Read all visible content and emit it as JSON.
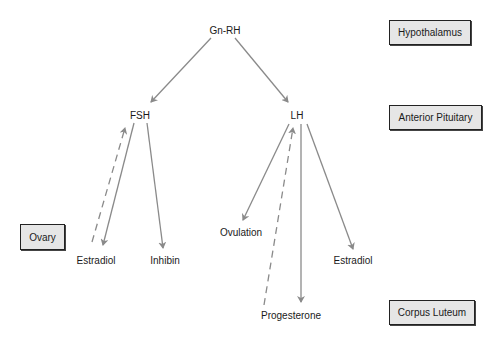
{
  "diagram": {
    "colors": {
      "arrow": "#8a8a8a",
      "box_fill": "#e6e6e6",
      "box_border": "#222222",
      "text": "#1a1a1a"
    },
    "nodes": {
      "gnrh": "Gn-RH",
      "fsh": "FSH",
      "lh": "LH",
      "estradiol_fsh": "Estradiol",
      "inhibin": "Inhibin",
      "ovulation": "Ovulation",
      "estradiol_lh": "Estradiol",
      "progesterone": "Progesterone"
    },
    "levels": {
      "hypothalamus": "Hypothalamus",
      "anterior_pituitary": "Anterior Pituitary",
      "ovary": "Ovary",
      "corpus_luteum": "Corpus Luteum"
    },
    "edges": [
      {
        "from": "Gn-RH",
        "to": "FSH",
        "style": "solid"
      },
      {
        "from": "Gn-RH",
        "to": "LH",
        "style": "solid"
      },
      {
        "from": "FSH",
        "to": "Estradiol",
        "style": "solid"
      },
      {
        "from": "FSH",
        "to": "Inhibin",
        "style": "solid"
      },
      {
        "from": "Estradiol",
        "to": "FSH",
        "style": "dashed"
      },
      {
        "from": "LH",
        "to": "Ovulation",
        "style": "solid"
      },
      {
        "from": "LH",
        "to": "Progesterone",
        "style": "solid"
      },
      {
        "from": "LH",
        "to": "Estradiol",
        "style": "solid"
      },
      {
        "from": "Progesterone",
        "to": "LH",
        "style": "dashed"
      }
    ]
  }
}
